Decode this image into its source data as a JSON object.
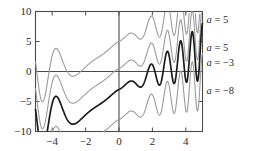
{
  "chart_data": {
    "type": "line",
    "title": "",
    "xlabel": "",
    "ylabel": "",
    "xlim": [
      -5,
      5
    ],
    "ylim": [
      -10,
      10
    ],
    "grid": false,
    "legend_position": "right-inline",
    "x_ticks": [
      "-4",
      "-2",
      "0",
      "2",
      "4"
    ],
    "x_tick_values": [
      -4,
      -2,
      0,
      2,
      4
    ],
    "y_ticks": [
      "10",
      "5",
      "0",
      "-5",
      "-10"
    ],
    "y_tick_values": [
      10,
      5,
      0,
      -5,
      -10
    ],
    "axis_lines": {
      "x_axis_at": 0,
      "y_axis_at": 0
    },
    "series": [
      {
        "name": "a = 5",
        "label_var": "a",
        "label_eq": "=",
        "label_value": "5",
        "color": "#9b9b9b",
        "width": 1.1,
        "emphasis": false,
        "offset": 5,
        "label_y": 15
      },
      {
        "name": "a = 5",
        "label_var": "a",
        "label_eq": "=",
        "label_value": "5",
        "color": "#9b9b9b",
        "width": 1.1,
        "emphasis": false,
        "offset": 0.5,
        "label_y": 43
      },
      {
        "name": "a = -3",
        "label_var": "a",
        "label_eq": "=",
        "label_value": "−3",
        "color": "#1c1c1c",
        "width": 1.7,
        "emphasis": true,
        "offset": -3,
        "label_y": 58
      },
      {
        "name": "a = -8",
        "label_var": "a",
        "label_eq": "=",
        "label_value": "−8",
        "color": "#9b9b9b",
        "width": 1.1,
        "emphasis": false,
        "offset": -8,
        "label_y": 86
      }
    ],
    "curve_form": "y = x + sin-type oscillation + a",
    "colors": {
      "axis": "#4a4a4a",
      "frame": "#4a4a4a",
      "gray_curve": "#9b9b9b",
      "black_curve": "#1c1c1c",
      "background": "#ffffff",
      "text": "#2b2b2b"
    }
  },
  "annotations": [
    {
      "var": "a",
      "eq": "=",
      "value": "5"
    },
    {
      "var": "a",
      "eq": "=",
      "value": "5"
    },
    {
      "var": "a",
      "eq": "=",
      "value": "−3"
    },
    {
      "var": "a",
      "eq": "=",
      "value": "−8"
    }
  ],
  "y_axis": {
    "labels": [
      "10",
      "5",
      "0",
      "−5",
      "−10"
    ]
  },
  "x_axis": {
    "labels": [
      "−4",
      "−2",
      "0",
      "2",
      "4"
    ]
  }
}
